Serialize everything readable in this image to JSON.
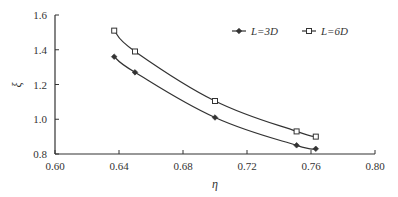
{
  "chart_data": {
    "type": "line",
    "title": "",
    "xlabel": "η",
    "ylabel": "ξ",
    "xlim": [
      0.6,
      0.8
    ],
    "ylim": [
      0.8,
      1.6
    ],
    "x_ticks": [
      "0.60",
      "0.64",
      "0.68",
      "0.72",
      "0.76",
      "0.80"
    ],
    "y_ticks": [
      "0.8",
      "1.0",
      "1.2",
      "1.4",
      "1.6"
    ],
    "grid": false,
    "legend_position": "top-right",
    "series": [
      {
        "name": "L=3D",
        "marker": "diamond",
        "x": [
          0.637,
          0.65,
          0.7,
          0.751,
          0.763
        ],
        "y": [
          1.36,
          1.27,
          1.01,
          0.85,
          0.83
        ]
      },
      {
        "name": "L=6D",
        "marker": "square",
        "x": [
          0.637,
          0.65,
          0.7,
          0.751,
          0.763
        ],
        "y": [
          1.51,
          1.39,
          1.105,
          0.93,
          0.9
        ]
      }
    ]
  },
  "colors": {
    "line": "#333333",
    "axis": "#333333"
  }
}
